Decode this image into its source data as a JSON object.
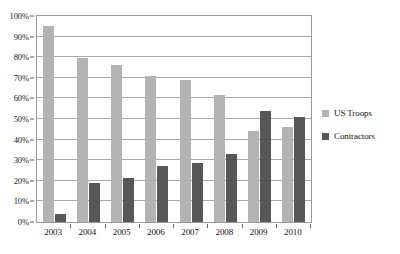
{
  "chart_data": {
    "type": "bar",
    "title": "",
    "xlabel": "",
    "ylabel": "",
    "categories": [
      "2003",
      "2004",
      "2005",
      "2006",
      "2007",
      "2008",
      "2009",
      "2010"
    ],
    "series": [
      {
        "name": "US Troops",
        "color": "#b3b3b3",
        "values": [
          95,
          79.5,
          76,
          71,
          69,
          61.5,
          44,
          46
        ]
      },
      {
        "name": "Contractors",
        "color": "#575757",
        "values": [
          4,
          19,
          21.5,
          27,
          28.5,
          33,
          54,
          51
        ]
      }
    ],
    "ylim": [
      0,
      100
    ],
    "ytick_labels": [
      "0%",
      "10%",
      "20%",
      "30%",
      "40%",
      "50%",
      "60%",
      "70%",
      "80%",
      "90%",
      "100%"
    ],
    "ytick_values": [
      0,
      10,
      20,
      30,
      40,
      50,
      60,
      70,
      80,
      90,
      100
    ],
    "grid": true,
    "legend_position": "right",
    "plot_border_color": "#9a9a9a",
    "gridline_color": "#a8a8a8",
    "background_color": "#ffffff"
  },
  "legend": {
    "items": [
      {
        "label": "US Troops",
        "swatch_name": "legend-swatch-us-troops"
      },
      {
        "label": "Contractors",
        "swatch_name": "legend-swatch-contractors"
      }
    ]
  }
}
